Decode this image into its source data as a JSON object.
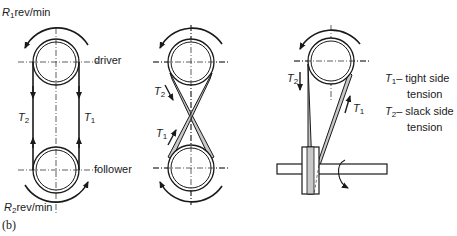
{
  "figure": {
    "caption": "(b)"
  },
  "open_belt": {
    "driver_speed": "R",
    "driver_speed_sub": "1",
    "driver_speed_unit": "rev/min",
    "follower_speed": "R",
    "follower_speed_sub": "2",
    "follower_speed_unit": "rev/min",
    "driver_label": "driver",
    "follower_label": "follower",
    "left_tension": "T",
    "left_tension_sub": "2",
    "right_tension": "T",
    "right_tension_sub": "1"
  },
  "crossed_belt": {
    "tension_a": "T",
    "tension_a_sub": "2",
    "tension_b": "T",
    "tension_b_sub": "1"
  },
  "quarter_turn_belt": {
    "tension_a": "T",
    "tension_a_sub": "2",
    "tension_b": "T",
    "tension_b_sub": "1"
  },
  "legend": {
    "t1_symbol": "T",
    "t1_sub": "1",
    "t1_text_line1": "– tight side",
    "t1_text_line2": "tension",
    "t2_symbol": "T",
    "t2_sub": "2",
    "t2_text_line1": "– slack side",
    "t2_text_line2": "tension"
  },
  "colors": {
    "ink": "#1a1a1a",
    "belt_fill": "#c8c8c8",
    "background": "#ffffff"
  }
}
